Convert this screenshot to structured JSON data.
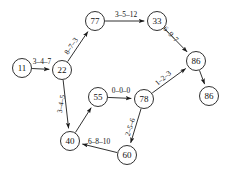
{
  "diagram": {
    "background_color": "#ffffff",
    "stroke_color": "#1a1a1a",
    "text_color": "#111111",
    "nodes": [
      {
        "id": "n11",
        "label": "11",
        "x": 22,
        "y": 68,
        "r": 9.5
      },
      {
        "id": "n22",
        "label": "22",
        "x": 62,
        "y": 70,
        "r": 9.5
      },
      {
        "id": "n77",
        "label": "77",
        "x": 95,
        "y": 21,
        "r": 9.5
      },
      {
        "id": "n33",
        "label": "33",
        "x": 157,
        "y": 21,
        "r": 9.5
      },
      {
        "id": "n86a",
        "label": "86",
        "x": 196,
        "y": 61,
        "r": 9.5
      },
      {
        "id": "n86b",
        "label": "86",
        "x": 209,
        "y": 96,
        "r": 9.5
      },
      {
        "id": "n55",
        "label": "55",
        "x": 98,
        "y": 97,
        "r": 9.5
      },
      {
        "id": "n78",
        "label": "78",
        "x": 144,
        "y": 99,
        "r": 9.5
      },
      {
        "id": "n40",
        "label": "40",
        "x": 70,
        "y": 141,
        "r": 9.5
      },
      {
        "id": "n60",
        "label": "60",
        "x": 127,
        "y": 155,
        "r": 9.5
      }
    ],
    "edges": [
      {
        "id": "e-11-22",
        "from": "n11",
        "to": "n22",
        "label": "3–4–7",
        "lx": 42,
        "ly": 61,
        "rot": 0
      },
      {
        "id": "e-22-77",
        "from": "n22",
        "to": "n77",
        "label": "8–7–3",
        "lx": 71,
        "ly": 46,
        "rot": -56
      },
      {
        "id": "e-77-33",
        "from": "n77",
        "to": "n33",
        "label": "3–5–12",
        "lx": 126,
        "ly": 14,
        "rot": 0
      },
      {
        "id": "e-33-86",
        "from": "n33",
        "to": "n86a",
        "label": "6–9–7",
        "lx": 171,
        "ly": 34,
        "rot": 46
      },
      {
        "id": "e-86-86",
        "from": "n86a",
        "to": "n86b",
        "label": "",
        "lx": 0,
        "ly": 0,
        "rot": 0
      },
      {
        "id": "e-22-40",
        "from": "n22",
        "to": "n40",
        "label": "3–4–5",
        "lx": 61,
        "ly": 104,
        "rot": -79
      },
      {
        "id": "e-40-55",
        "from": "n40",
        "to": "n55",
        "label": "",
        "lx": 0,
        "ly": 0,
        "rot": 0
      },
      {
        "id": "e-55-78",
        "from": "n55",
        "to": "n78",
        "label": "0–0–0",
        "lx": 121,
        "ly": 90,
        "rot": 0
      },
      {
        "id": "e-78-86",
        "from": "n78",
        "to": "n86a",
        "label": "1–2–3",
        "lx": 163,
        "ly": 78,
        "rot": -40
      },
      {
        "id": "e-78-60",
        "from": "n78",
        "to": "n60",
        "label": "2–5–6",
        "lx": 130,
        "ly": 127,
        "rot": -72
      },
      {
        "id": "e-60-40",
        "from": "n60",
        "to": "n40",
        "label": "6–8–10",
        "lx": 99,
        "ly": 141,
        "rot": 0
      }
    ]
  }
}
